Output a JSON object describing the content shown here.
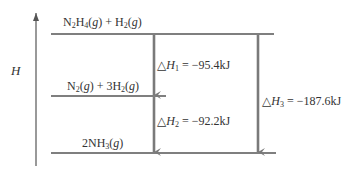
{
  "diagram": {
    "type": "enthalpy-level-diagram",
    "axis": {
      "label": "H"
    },
    "levels": [
      {
        "id": "top",
        "species": "N2H4(g) + H2(g)"
      },
      {
        "id": "middle",
        "species": "N2(g) + 3H2(g)"
      },
      {
        "id": "bottom",
        "species": "2NH3(g)"
      }
    ],
    "arrows": [
      {
        "id": "dh1",
        "from": "top",
        "to": "middle",
        "label": "ΔH1 = −95.4kJ",
        "symbol": "△H",
        "subscript": "1",
        "value": "−95.4kJ"
      },
      {
        "id": "dh2",
        "from": "middle",
        "to": "bottom",
        "label": "ΔH2 = −92.2kJ",
        "symbol": "△H",
        "subscript": "2",
        "value": "−92.2kJ"
      },
      {
        "id": "dh3",
        "from": "top",
        "to": "bottom",
        "label": "ΔH3 = −187.6kJ",
        "symbol": "△H",
        "subscript": "3",
        "value": "−187.6kJ"
      }
    ],
    "colors": {
      "arrow": "#7a7a7a",
      "line": "#555555",
      "text": "#333333"
    }
  },
  "text": {
    "axis_h": "H",
    "top_a": "N",
    "top_a_sub": "2",
    "top_b": "H",
    "top_b_sub": "4",
    "top_c": "g",
    "top_d": "H",
    "top_d_sub": "2",
    "top_e": "g",
    "mid_a": "N",
    "mid_a_sub": "2",
    "mid_c": "g",
    "mid_d": "3H",
    "mid_d_sub": "2",
    "mid_e": "g",
    "bot_a": "2NH",
    "bot_a_sub": "3",
    "bot_c": "g",
    "dh_symbol": "△",
    "dh_h": "H",
    "dh1_sub": "1",
    "dh1_val": " = −95.4kJ",
    "dh2_sub": "2",
    "dh2_val": " = −92.2kJ",
    "dh3_sub": "3",
    "dh3_val": " = −187.6kJ"
  }
}
